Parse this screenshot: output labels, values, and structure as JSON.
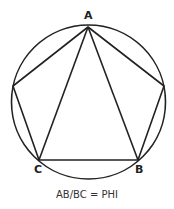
{
  "diagram": {
    "stroke_color": "#222222",
    "circle": {
      "cx": 88.5,
      "cy": 102,
      "r": 77
    },
    "vertices": {
      "A": {
        "label": "A",
        "x": 88,
        "y": 27
      },
      "B": {
        "label": "B",
        "x": 138,
        "y": 160
      },
      "C": {
        "label": "C",
        "x": 39,
        "y": 160
      },
      "left": {
        "x": 13,
        "y": 86
      },
      "right": {
        "x": 164,
        "y": 86
      }
    },
    "caption": "AB/BC = PHI"
  }
}
